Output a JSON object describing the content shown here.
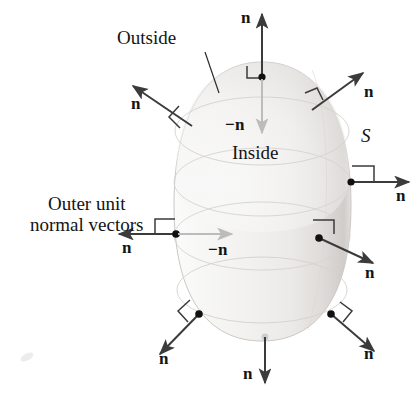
{
  "figure": {
    "type": "vector-field-diagram",
    "background_color": "#ffffff",
    "ink_color": "#141414",
    "arrow_dark_color": "#3b3b3b",
    "arrow_light_color": "#b9b9b9",
    "surface_fill": "#f4f4f4",
    "surface_edge": "#cfcfcf",
    "contour_color": "#d2cfcc"
  },
  "labels": {
    "outside": "Outside",
    "inside": "Inside",
    "surface": "S",
    "caption_line1": "Outer unit",
    "caption_line2": "normal vectors",
    "n": "n",
    "neg_n": "−n"
  },
  "vectors": [
    {
      "id": "top",
      "label": "n",
      "direction": "up",
      "label_position": "left-of-arrowhead",
      "has_right_angle_marker": true,
      "color": "dark",
      "base_point": [
        262,
        77
      ],
      "tip": [
        262,
        12
      ]
    },
    {
      "id": "top-inward",
      "label": "−n",
      "direction": "down",
      "label_position": "left-of-shaft",
      "has_right_angle_marker": false,
      "color": "light",
      "base_point": [
        262,
        77
      ],
      "tip": [
        262,
        134
      ]
    },
    {
      "id": "upper-left",
      "label": "n",
      "direction": "up-left",
      "label_position": "below-arrowhead",
      "has_right_angle_marker": true,
      "color": "dark",
      "base_point": [
        191,
        125
      ],
      "tip": [
        130,
        84
      ]
    },
    {
      "id": "upper-right",
      "label": "n",
      "direction": "up-right",
      "label_position": "right-of-arrowhead",
      "has_right_angle_marker": true,
      "color": "dark",
      "base_point": [
        313,
        108
      ],
      "tip": [
        362,
        72
      ]
    },
    {
      "id": "right-middle",
      "label": "n",
      "direction": "right",
      "label_position": "below-arrowhead",
      "has_right_angle_marker": true,
      "color": "dark",
      "base_point": [
        351,
        182
      ],
      "tip": [
        408,
        182
      ]
    },
    {
      "id": "left-middle",
      "label": "n",
      "direction": "left",
      "label_position": "below-arrowhead",
      "has_right_angle_marker": true,
      "color": "dark",
      "base_point": [
        176,
        234
      ],
      "tip": [
        121,
        234
      ]
    },
    {
      "id": "left-middle-inward",
      "label": "−n",
      "direction": "right",
      "label_position": "below-arrowhead",
      "has_right_angle_marker": false,
      "color": "light",
      "base_point": [
        176,
        234
      ],
      "tip": [
        231,
        234
      ]
    },
    {
      "id": "right-lower",
      "label": "n",
      "direction": "down-right",
      "label_position": "below-arrowhead",
      "has_right_angle_marker": true,
      "color": "dark",
      "base_point": [
        319,
        238
      ],
      "tip": [
        371,
        262
      ]
    },
    {
      "id": "lower-left",
      "label": "n",
      "direction": "down-left",
      "label_position": "below-arrowhead",
      "has_right_angle_marker": true,
      "color": "dark",
      "base_point": [
        199,
        314
      ],
      "tip": [
        162,
        352
      ]
    },
    {
      "id": "lower-right",
      "label": "n",
      "direction": "down-right",
      "label_position": "below-arrowhead",
      "has_right_angle_marker": true,
      "color": "dark",
      "base_point": [
        331,
        314
      ],
      "tip": [
        372,
        349
      ]
    },
    {
      "id": "bottom",
      "label": "n",
      "direction": "down",
      "label_position": "left-of-arrowhead",
      "has_right_angle_marker": false,
      "color": "dark",
      "base_point": [
        265,
        337
      ],
      "tip": [
        265,
        382
      ]
    }
  ],
  "annotations": {
    "outside_leader_from": [
      205,
      52
    ],
    "outside_leader_to": [
      218,
      92
    ],
    "smudge_at": [
      27,
      357
    ]
  }
}
